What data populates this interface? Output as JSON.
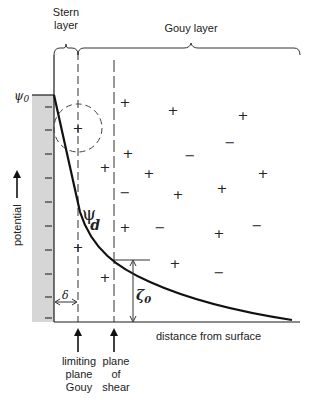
{
  "diagram": {
    "labels": {
      "stern_line1": "Stern",
      "stern_line2": "layer",
      "gouy_layer": "Gouy layer",
      "psi0": "ψ",
      "psi0_sub": "0",
      "psid": "ψ",
      "psid_sub": "d",
      "y_axis": "potential",
      "x_axis": "distance from surface",
      "delta": "δ",
      "zeta": "ζ",
      "zeta_sub": "0",
      "limiting_plane_1": "limiting",
      "limiting_plane_2": "plane",
      "limiting_plane_3": "Gouy",
      "shear_plane_1": "plane",
      "shear_plane_2": "of",
      "shear_plane_3": "shear"
    },
    "colors": {
      "ink": "#1a1a1a",
      "surface_fill": "#d6d6d6"
    },
    "ions": {
      "plus": "+",
      "minus": "−"
    }
  }
}
